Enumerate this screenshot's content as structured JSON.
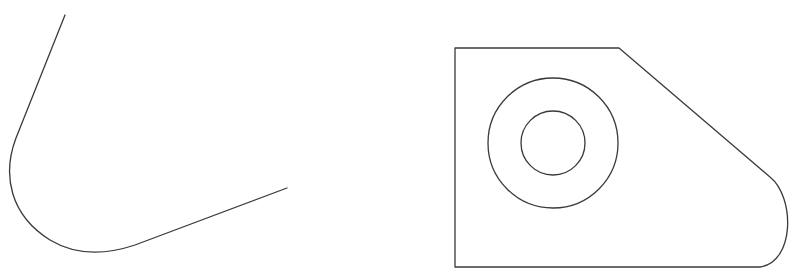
{
  "diagram": {
    "type": "technical-line-drawing",
    "stroke_color": "#3a3a3a",
    "background": "#ffffff",
    "figures": [
      {
        "name": "left-figure",
        "description": "open profile: straight line, fillet arc, straight line",
        "path": "M65 15 L16 138 C 2 175, 10 215, 50 240 C 75 255, 105 255, 135 245 L287 188"
      },
      {
        "name": "right-figure",
        "description": "plate outline with chamfered side and rounded corner, containing two concentric circles",
        "outline_path": "M455 48 L619 48 L770 177 C 795 197, 795 262, 760 267 L455 267 Z",
        "circles": [
          {
            "name": "outer-circle",
            "cx": 553,
            "cy": 143,
            "r": 65
          },
          {
            "name": "inner-circle",
            "cx": 553,
            "cy": 143,
            "r": 32
          }
        ]
      }
    ]
  }
}
